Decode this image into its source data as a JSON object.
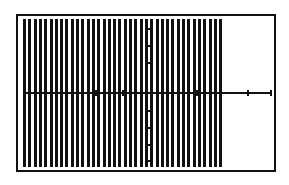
{
  "chart_data": {
    "type": "bar",
    "title": "",
    "xlabel": "",
    "ylabel": "",
    "grid": false,
    "legend": null,
    "bar_count": 38,
    "bar_pitch_px": 5.3,
    "bar_width_px": 3,
    "bars_extent_fraction": [
      0.0,
      0.77
    ],
    "x_axis_y_fraction": 0.5,
    "y_axis_x_fraction": 0.5,
    "x_tick_positions_px": [
      95,
      122,
      172,
      196,
      247,
      270
    ],
    "y_tick_positions_px": [
      28,
      45,
      62,
      110,
      127,
      144,
      160
    ]
  },
  "window": {
    "frame_left": 16,
    "frame_top": 14,
    "frame_right": 276,
    "frame_bottom": 172
  }
}
